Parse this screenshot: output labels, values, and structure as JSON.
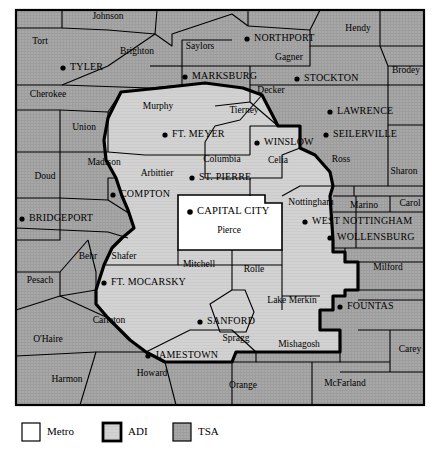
{
  "map": {
    "title": "Metro / ADI / TSA coverage map",
    "colors": {
      "metro_fill": "#ffffff",
      "adi_fill": "#d2d2d2",
      "tsa_fill": "#a8a8a8",
      "border": "#000000",
      "frame": "#000000",
      "text": "#000000"
    },
    "frame": {
      "x": 16,
      "y": 10,
      "width": 408,
      "height": 395
    },
    "counties": [
      {
        "name": "Johnson",
        "x": 108,
        "y": 17,
        "zone": "TSA"
      },
      {
        "name": "Tort",
        "x": 40,
        "y": 42,
        "zone": "TSA"
      },
      {
        "name": "Brighton",
        "x": 137,
        "y": 52,
        "zone": "TSA"
      },
      {
        "name": "Saylors",
        "x": 200,
        "y": 47,
        "zone": "TSA"
      },
      {
        "name": "Gagner",
        "x": 289,
        "y": 58,
        "zone": "TSA"
      },
      {
        "name": "Hendy",
        "x": 358,
        "y": 29,
        "zone": "TSA"
      },
      {
        "name": "Brodey",
        "x": 406,
        "y": 71,
        "zone": "TSA"
      },
      {
        "name": "Cherokee",
        "x": 48,
        "y": 95,
        "zone": "TSA"
      },
      {
        "name": "Decker",
        "x": 271,
        "y": 91,
        "zone": "TSA"
      },
      {
        "name": "Murphy",
        "x": 158,
        "y": 107,
        "zone": "ADI"
      },
      {
        "name": "Tierney",
        "x": 244,
        "y": 111,
        "zone": "ADI"
      },
      {
        "name": "Union",
        "x": 84,
        "y": 128,
        "zone": "TSA"
      },
      {
        "name": "Madison",
        "x": 104,
        "y": 163,
        "zone": "TSA"
      },
      {
        "name": "Arbittier",
        "x": 157,
        "y": 174,
        "zone": "ADI"
      },
      {
        "name": "Columbia",
        "x": 222,
        "y": 160,
        "zone": "ADI"
      },
      {
        "name": "Celia",
        "x": 278,
        "y": 161,
        "zone": "ADI"
      },
      {
        "name": "Ross",
        "x": 341,
        "y": 160,
        "zone": "TSA"
      },
      {
        "name": "Sharon",
        "x": 404,
        "y": 172,
        "zone": "TSA"
      },
      {
        "name": "Doud",
        "x": 45,
        "y": 177,
        "zone": "TSA"
      },
      {
        "name": "Nottingham",
        "x": 311,
        "y": 203,
        "zone": "TSA"
      },
      {
        "name": "Marino",
        "x": 364,
        "y": 206,
        "zone": "TSA"
      },
      {
        "name": "Carol",
        "x": 410,
        "y": 204,
        "zone": "TSA"
      },
      {
        "name": "Pierce",
        "x": 229,
        "y": 231,
        "zone": "Metro"
      },
      {
        "name": "Behr",
        "x": 88,
        "y": 257,
        "zone": "TSA"
      },
      {
        "name": "Shafer",
        "x": 124,
        "y": 257,
        "zone": "ADI"
      },
      {
        "name": "Mitchell",
        "x": 199,
        "y": 265,
        "zone": "ADI"
      },
      {
        "name": "Rolle",
        "x": 254,
        "y": 270,
        "zone": "ADI"
      },
      {
        "name": "Milford",
        "x": 388,
        "y": 268,
        "zone": "TSA"
      },
      {
        "name": "Pesach",
        "x": 40,
        "y": 281,
        "zone": "TSA"
      },
      {
        "name": "Lake Merkin",
        "x": 292,
        "y": 301,
        "zone": "ADI"
      },
      {
        "name": "Carleton",
        "x": 109,
        "y": 321,
        "zone": "TSA"
      },
      {
        "name": "O'Haire",
        "x": 48,
        "y": 340,
        "zone": "TSA"
      },
      {
        "name": "Spragg",
        "x": 236,
        "y": 339,
        "zone": "ADI"
      },
      {
        "name": "Mishagosh",
        "x": 299,
        "y": 345,
        "zone": "ADI"
      },
      {
        "name": "Carey",
        "x": 410,
        "y": 350,
        "zone": "TSA"
      },
      {
        "name": "Howard",
        "x": 152,
        "y": 374,
        "zone": "TSA"
      },
      {
        "name": "Harmon",
        "x": 67,
        "y": 380,
        "zone": "TSA"
      },
      {
        "name": "Orange",
        "x": 243,
        "y": 386,
        "zone": "TSA"
      },
      {
        "name": "McFarland",
        "x": 345,
        "y": 384,
        "zone": "TSA"
      }
    ],
    "cities": [
      {
        "name": "TYLER",
        "dot_x": 63,
        "dot_y": 68,
        "label_x": 70,
        "label_y": 68
      },
      {
        "name": "NORTHPORT",
        "dot_x": 247,
        "dot_y": 39,
        "label_x": 254,
        "label_y": 39
      },
      {
        "name": "MARKSBURG",
        "dot_x": 185,
        "dot_y": 77,
        "label_x": 192,
        "label_y": 77
      },
      {
        "name": "STOCKTON",
        "dot_x": 297,
        "dot_y": 79,
        "label_x": 304,
        "label_y": 79
      },
      {
        "name": "LAWRENCE",
        "dot_x": 330,
        "dot_y": 112,
        "label_x": 337,
        "label_y": 112
      },
      {
        "name": "FT. MEYER",
        "dot_x": 165,
        "dot_y": 135,
        "label_x": 172,
        "label_y": 135
      },
      {
        "name": "WINSLOW",
        "dot_x": 257,
        "dot_y": 143,
        "label_x": 264,
        "label_y": 143
      },
      {
        "name": "SEILERVILLE",
        "dot_x": 326,
        "dot_y": 135,
        "label_x": 333,
        "label_y": 135
      },
      {
        "name": "ST. PIERRE",
        "dot_x": 192,
        "dot_y": 178,
        "label_x": 199,
        "label_y": 178
      },
      {
        "name": "COMPTON",
        "dot_x": 113,
        "dot_y": 195,
        "label_x": 120,
        "label_y": 195
      },
      {
        "name": "BRIDGEPORT",
        "dot_x": 22,
        "dot_y": 219,
        "label_x": 29,
        "label_y": 219
      },
      {
        "name": "CAPITAL CITY",
        "dot_x": 190,
        "dot_y": 212,
        "label_x": 197,
        "label_y": 212
      },
      {
        "name": "WEST NOTTINGHAM",
        "dot_x": 305,
        "dot_y": 222,
        "label_x": 312,
        "label_y": 222
      },
      {
        "name": "WOLLENSBURG",
        "dot_x": 330,
        "dot_y": 238,
        "label_x": 337,
        "label_y": 238
      },
      {
        "name": "FT. MOCARSKY",
        "dot_x": 104,
        "dot_y": 283,
        "label_x": 111,
        "label_y": 283
      },
      {
        "name": "FOUNTAS",
        "dot_x": 340,
        "dot_y": 307,
        "label_x": 347,
        "label_y": 307
      },
      {
        "name": "SANFORD",
        "dot_x": 200,
        "dot_y": 322,
        "label_x": 207,
        "label_y": 322
      },
      {
        "name": "JAMESTOWN",
        "dot_x": 148,
        "dot_y": 356,
        "label_x": 155,
        "label_y": 356
      }
    ]
  },
  "legend": {
    "items": [
      {
        "label": "Metro",
        "fill": "#ffffff",
        "stroke_width": 1,
        "swatch_x": 22,
        "label_x": 47
      },
      {
        "label": "ADI",
        "fill": "#d2d2d2",
        "stroke_width": 2.5,
        "swatch_x": 103,
        "label_x": 128
      },
      {
        "label": "TSA",
        "fill": "#a8a8a8",
        "stroke_width": 1,
        "swatch_x": 173,
        "label_x": 198
      }
    ],
    "swatch_y": 423,
    "swatch_size": 18
  }
}
